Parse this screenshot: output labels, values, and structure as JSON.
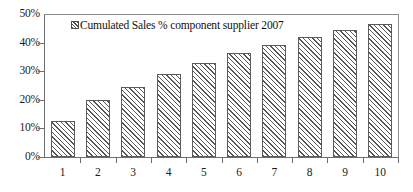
{
  "chart_data": {
    "type": "bar",
    "title": "",
    "subtitle": "",
    "xlabel": "",
    "ylabel": "",
    "categories": [
      "1",
      "2",
      "3",
      "4",
      "5",
      "6",
      "7",
      "8",
      "9",
      "10"
    ],
    "values": [
      12.5,
      20.0,
      24.5,
      29.2,
      33.0,
      36.3,
      39.3,
      42.0,
      44.3,
      46.5
    ],
    "series": [
      {
        "name": "Cumulated Sales % component supplier 2007",
        "values": [
          12.5,
          20.0,
          24.5,
          29.2,
          33.0,
          36.3,
          39.3,
          42.0,
          44.3,
          46.5
        ]
      }
    ],
    "ylim": [
      0,
      50
    ],
    "ytick_labels": [
      "0%",
      "10%",
      "20%",
      "30%",
      "40%",
      "50%"
    ],
    "ytick_values": [
      0,
      10,
      20,
      30,
      40,
      50
    ],
    "xtick_labels": [
      "1",
      "2",
      "3",
      "4",
      "5",
      "6",
      "7",
      "8",
      "9",
      "10"
    ],
    "grid": false,
    "legend_position": "top-left-inside",
    "bar_fill": "diagonal-hatch",
    "bar_edge_color": "#5b5b5b",
    "axis_color": "#6e6e6e",
    "background_color": "#ffffff"
  },
  "legend": {
    "entries": [
      {
        "label": "Cumulated Sales % component supplier 2007",
        "marker": "hatched-square-swatch"
      }
    ]
  }
}
